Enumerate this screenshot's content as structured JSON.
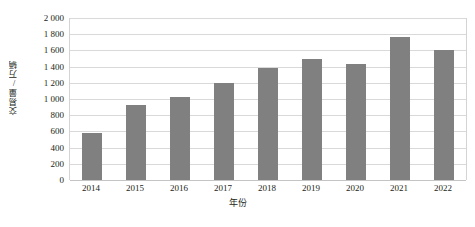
{
  "chart_data": {
    "type": "bar",
    "title": "",
    "subtitle": "",
    "xlabel": "年份",
    "ylabel": "交易量/万辆",
    "categories": [
      "2014",
      "2015",
      "2016",
      "2017",
      "2018",
      "2019",
      "2020",
      "2021",
      "2022"
    ],
    "values": [
      580,
      920,
      1030,
      1200,
      1380,
      1490,
      1430,
      1760,
      1600
    ],
    "ylim": [
      0,
      2000
    ],
    "ytick_step": 200,
    "ytick_labels": [
      "2 000",
      "1 800",
      "1 600",
      "1 400",
      "1 200",
      "1 000",
      "800",
      "600",
      "400",
      "200",
      "0"
    ],
    "ytick_values": [
      2000,
      1800,
      1600,
      1400,
      1200,
      1000,
      800,
      600,
      400,
      200,
      0
    ],
    "grid": true,
    "legend": "none",
    "legend_position": "none",
    "series": [
      {
        "name": "交易量",
        "color": "#808080",
        "values": [
          580,
          920,
          1030,
          1200,
          1380,
          1490,
          1430,
          1760,
          1600
        ]
      }
    ],
    "annotations": []
  },
  "colors": {
    "bar": "#808080",
    "gridline": "#d9d9d9",
    "axis": "#c4c4c4",
    "text": "#231f20",
    "background": "#ffffff"
  }
}
